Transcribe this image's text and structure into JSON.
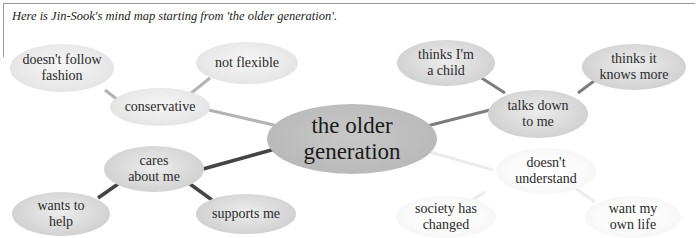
{
  "caption": "Here is Jin-Sook's mind map starting from 'the older generation'.",
  "center": {
    "label": "the older\ngeneration"
  },
  "branches": [
    {
      "label": "conservative",
      "children": [
        {
          "label": "doesn't follow\nfashion"
        },
        {
          "label": "not flexible"
        }
      ]
    },
    {
      "label": "talks down\nto me",
      "children": [
        {
          "label": "thinks I'm\na child"
        },
        {
          "label": "thinks it\nknows more"
        }
      ]
    },
    {
      "label": "cares\nabout me",
      "children": [
        {
          "label": "wants to\nhelp"
        },
        {
          "label": "supports me"
        }
      ]
    },
    {
      "label": "doesn't\nunderstand",
      "children": [
        {
          "label": "society has\nchanged"
        },
        {
          "label": "want my\nown life"
        }
      ]
    }
  ],
  "colors": {
    "line_light": "#b0b0b0",
    "line_mid": "#8a8a8a",
    "line_dark": "#4a4a4a",
    "line_faint": "#ececec",
    "center_fill": "#bcbcbc"
  }
}
